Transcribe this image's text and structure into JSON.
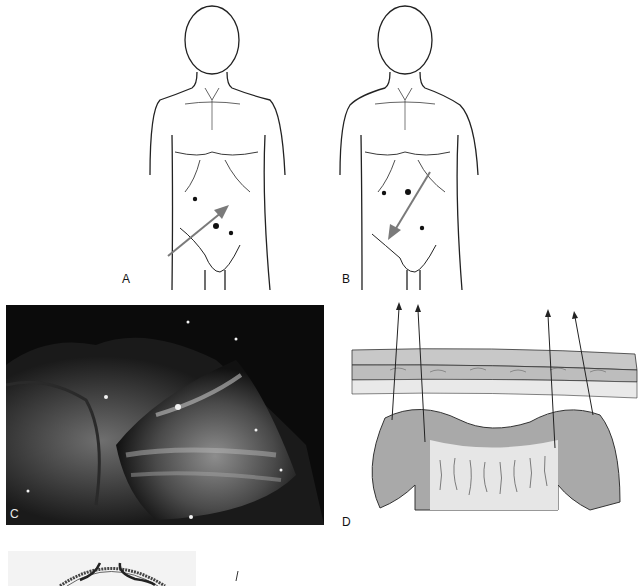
{
  "figure": {
    "panels": [
      {
        "id": "A",
        "label": "A",
        "type": "line-drawing",
        "content": "frontal torso with three port-site dots and arrow pointing toward upper right"
      },
      {
        "id": "B",
        "label": "B",
        "type": "line-drawing",
        "content": "frontal torso with three port-site dots and arrow pointing toward lower left"
      },
      {
        "id": "C",
        "label": "C",
        "type": "photograph",
        "content": "grayscale endoscopic/laparoscopic view of tissue"
      },
      {
        "id": "D",
        "label": "D",
        "type": "line-drawing",
        "content": "abdominal wall layers with four sutures passed through tissue, arrows pointing up"
      },
      {
        "id": "E",
        "label": "",
        "type": "line-drawing",
        "content": "partially visible cross-section drawing at bottom"
      }
    ]
  },
  "colors": {
    "line": "#222222",
    "arrow": "#7a7a7a",
    "tissue_gray": "#a9a9a9",
    "wall_gray": "#c8c8c8",
    "photo_bg": "#0c0c0c"
  }
}
